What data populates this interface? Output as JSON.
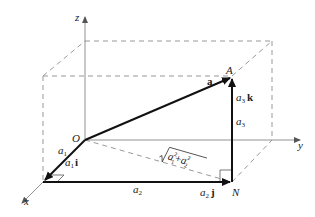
{
  "diagram": {
    "type": "3d-vector-decomposition",
    "axes": {
      "x": "x",
      "y": "y",
      "z": "z"
    },
    "points": {
      "origin": "O",
      "tip": "A",
      "foot": "N"
    },
    "vectors": {
      "a": "a",
      "a1i": {
        "coef": "a",
        "sub": "1",
        "unit": "i"
      },
      "a2j": {
        "coef": "a",
        "sub": "2",
        "unit": "j"
      },
      "a3k": {
        "coef": "a",
        "sub": "3",
        "unit": "k"
      }
    },
    "lengths": {
      "a1": {
        "base": "a",
        "sub": "1"
      },
      "a2": {
        "base": "a",
        "sub": "2"
      },
      "a3": {
        "base": "a",
        "sub": "3"
      },
      "diag": {
        "t1": "a",
        "s1": "1",
        "e1": "2",
        "plus": "+",
        "t2": "a",
        "s2": "2",
        "e2": "2"
      }
    },
    "colors": {
      "solid": "#111111",
      "axis": "#777777",
      "dashed": "#999999"
    }
  }
}
